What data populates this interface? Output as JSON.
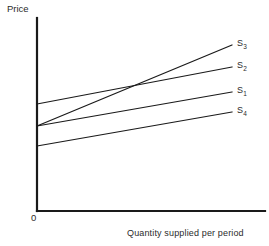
{
  "figure": {
    "background": "#ffffff",
    "ink_color": "#1a1a1a",
    "text_color": "#2b2b2b",
    "width": 269,
    "height": 246
  },
  "axes": {
    "y_axis_label": "Price",
    "x_axis_label": "Quantity supplied per period",
    "origin_label": "0",
    "y_axis": {
      "x": 37,
      "y_top": 18,
      "y_bottom": 211
    },
    "x_axis": {
      "y": 211,
      "x_left": 37,
      "x_right": 265
    }
  },
  "chart_data": {
    "type": "line",
    "title": "",
    "xlabel": "Quantity supplied per period",
    "ylabel": "Price",
    "grid": false,
    "legend_position": "right-of-line-ends",
    "axis_ticks": {
      "x": [],
      "y": []
    },
    "origin_label": "0",
    "series": [
      {
        "name": "S3",
        "label_base": "S",
        "label_sub": "3",
        "x0": 37,
        "y0": 126,
        "x1": 232,
        "y1": 45,
        "label_x": 237,
        "label_y": 38,
        "note": "steepest curve, crosses S2 near x=145"
      },
      {
        "name": "S2",
        "label_base": "S",
        "label_sub": "2",
        "x0": 37,
        "y0": 104,
        "x1": 232,
        "y1": 67,
        "label_x": 237,
        "label_y": 60,
        "note": "highest y-intercept"
      },
      {
        "name": "S1",
        "label_base": "S",
        "label_sub": "1",
        "x0": 37,
        "y0": 126,
        "x1": 232,
        "y1": 92,
        "label_x": 237,
        "label_y": 85,
        "note": "shares y-intercept with S3"
      },
      {
        "name": "S4",
        "label_base": "S",
        "label_sub": "4",
        "x0": 37,
        "y0": 146,
        "x1": 232,
        "y1": 112,
        "label_x": 237,
        "label_y": 105,
        "note": "lowest y-intercept, flattest"
      }
    ]
  }
}
